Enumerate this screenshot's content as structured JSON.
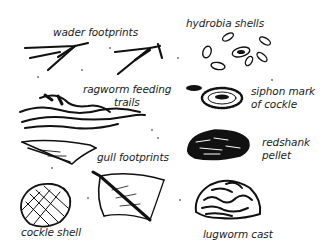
{
  "diagram": {
    "type": "illustration",
    "labels": [
      {
        "id": "wader-footprints",
        "text": "wader footprints"
      },
      {
        "id": "hydrobia-shells",
        "text": "hydrobia shells"
      },
      {
        "id": "ragworm-feeding-trails",
        "line1": "ragworm feeding",
        "line2": "trails"
      },
      {
        "id": "siphon-mark-of-cockle",
        "line1": "siphon mark",
        "line2": "of cockle"
      },
      {
        "id": "redshank-pellet",
        "line1": "redshank",
        "line2": "pellet"
      },
      {
        "id": "gull-footprints",
        "text": "gull footprints"
      },
      {
        "id": "cockle-shell",
        "text": "cockle shell"
      },
      {
        "id": "lugworm-cast",
        "text": "lugworm cast"
      }
    ],
    "colors": {
      "ink": "#111111",
      "background": "#ffffff"
    }
  }
}
